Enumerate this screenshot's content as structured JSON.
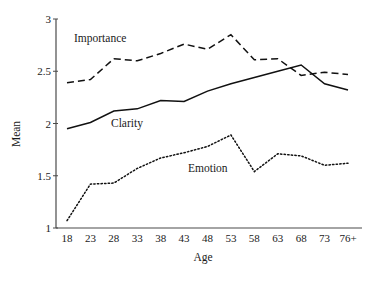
{
  "chart_data": {
    "type": "line",
    "title": "",
    "xlabel": "Age",
    "ylabel": "Mean",
    "categories": [
      "18",
      "23",
      "28",
      "33",
      "38",
      "43",
      "48",
      "53",
      "58",
      "63",
      "68",
      "73",
      "76+"
    ],
    "ylim": [
      1,
      3
    ],
    "xlim_index": [
      0,
      12
    ],
    "yticks": [
      "1",
      "1.5",
      "2",
      "2.5",
      "3"
    ],
    "ytick_values": [
      1,
      1.5,
      2,
      2.5,
      3
    ],
    "grid": false,
    "legend": "inline-labels",
    "series": [
      {
        "name": "Importance",
        "style": "dashed",
        "color": "#111111",
        "values": [
          2.39,
          2.42,
          2.62,
          2.6,
          2.67,
          2.76,
          2.71,
          2.85,
          2.61,
          2.62,
          2.46,
          2.49,
          2.47
        ]
      },
      {
        "name": "Clarity",
        "style": "solid",
        "color": "#111111",
        "values": [
          1.95,
          2.01,
          2.12,
          2.14,
          2.22,
          2.21,
          2.31,
          2.38,
          2.44,
          2.5,
          2.56,
          2.38,
          2.32
        ]
      },
      {
        "name": "Emotion",
        "style": "dotted",
        "color": "#111111",
        "values": [
          1.07,
          1.42,
          1.43,
          1.57,
          1.67,
          1.72,
          1.78,
          1.89,
          1.54,
          1.71,
          1.69,
          1.6,
          1.62
        ]
      }
    ],
    "annotations": [
      {
        "text": "Importance",
        "x_px": 74,
        "y_px": 33
      },
      {
        "text": "Clarity",
        "x_px": 111,
        "y_px": 118
      },
      {
        "text": "Emotion",
        "x_px": 188,
        "y_px": 163
      }
    ]
  },
  "axes": {
    "y_title": "Mean",
    "x_title": "Age"
  }
}
